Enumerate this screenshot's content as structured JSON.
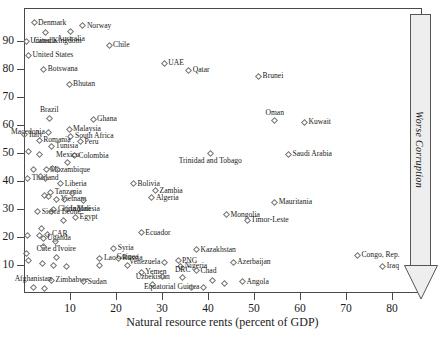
{
  "chart_data": {
    "type": "scatter",
    "title": "",
    "xlabel": "Natural resource rents (percent of GDP)",
    "ylabel": "",
    "xlim": [
      0,
      88
    ],
    "ylim": [
      0,
      98
    ],
    "xticks": [
      10,
      20,
      30,
      40,
      50,
      60,
      70,
      80
    ],
    "yticks": [
      10,
      20,
      30,
      40,
      50,
      60,
      70,
      80,
      90
    ],
    "grid": false,
    "legend": false,
    "annotation": {
      "text": "Worse Corruption",
      "direction": "down",
      "position": "right-outside"
    },
    "points": [
      {
        "label": "Denmark",
        "x": 2.2,
        "y": 96.5,
        "pos": "right"
      },
      {
        "label": "Norway",
        "x": 12.8,
        "y": 95.5,
        "pos": "right"
      },
      {
        "label": "Australia",
        "x": 10.2,
        "y": 93.5,
        "pos": "below"
      },
      {
        "label": "Canada",
        "x": 4.6,
        "y": 93.0,
        "pos": "below"
      },
      {
        "label": "Chile",
        "x": 18.5,
        "y": 88.5,
        "pos": "right"
      },
      {
        "label": "United Kingdom",
        "x": 0.5,
        "y": 90.0,
        "pos": "right"
      },
      {
        "label": "United States",
        "x": 1.0,
        "y": 85.0,
        "pos": "right"
      },
      {
        "label": "Botswana",
        "x": 4.3,
        "y": 80.0,
        "pos": "right"
      },
      {
        "label": "UAE",
        "x": 30.5,
        "y": 82.0,
        "pos": "right"
      },
      {
        "label": "Qatar",
        "x": 35.8,
        "y": 79.5,
        "pos": "right"
      },
      {
        "label": "Brunei",
        "x": 51.0,
        "y": 77.5,
        "pos": "right"
      },
      {
        "label": "Bhutan",
        "x": 9.8,
        "y": 74.5,
        "pos": "right"
      },
      {
        "label": "Brazil",
        "x": 5.5,
        "y": 62.5,
        "pos": "above"
      },
      {
        "label": "Ghana",
        "x": 15.0,
        "y": 62.0,
        "pos": "right"
      },
      {
        "label": "Oman",
        "x": 54.5,
        "y": 61.5,
        "pos": "above"
      },
      {
        "label": "Kuwait",
        "x": 61.0,
        "y": 61.0,
        "pos": "right"
      },
      {
        "label": "Malaysia",
        "x": 9.8,
        "y": 58.5,
        "pos": "right"
      },
      {
        "label": "Macedonia",
        "x": 5.4,
        "y": 57.5,
        "pos": "left"
      },
      {
        "label": "South Africa",
        "x": 10.2,
        "y": 56.0,
        "pos": "right"
      },
      {
        "label": "Italy",
        "x": 0.2,
        "y": 56.5,
        "pos": "right"
      },
      {
        "label": "Romania",
        "x": 3.3,
        "y": 54.5,
        "pos": "right"
      },
      {
        "label": "Peru",
        "x": 12.3,
        "y": 54.0,
        "pos": "right"
      },
      {
        "label": "Tunisia",
        "x": 6.0,
        "y": 52.5,
        "pos": "right"
      },
      {
        "label": "Colombia",
        "x": 11.0,
        "y": 49.0,
        "pos": "right"
      },
      {
        "label": "Trinidad and Tobago",
        "x": 40.5,
        "y": 50.0,
        "pos": "below"
      },
      {
        "label": "Saudi Arabia",
        "x": 57.5,
        "y": 49.5,
        "pos": "right"
      },
      {
        "label": "Mexico",
        "x": 9.5,
        "y": 46.5,
        "pos": "above"
      },
      {
        "label": "Mozambique",
        "x": 4.8,
        "y": 44.0,
        "pos": "right"
      },
      {
        "label": "Thailand",
        "x": 0.8,
        "y": 41.0,
        "pos": "right"
      },
      {
        "label": "Liberia",
        "x": 8.0,
        "y": 39.0,
        "pos": "right"
      },
      {
        "label": "Bolivia",
        "x": 23.8,
        "y": 39.0,
        "pos": "right"
      },
      {
        "label": "Zambia",
        "x": 28.6,
        "y": 36.5,
        "pos": "right"
      },
      {
        "label": "Tanzania",
        "x": 5.8,
        "y": 36.0,
        "pos": "right"
      },
      {
        "label": "Algeria",
        "x": 27.8,
        "y": 34.0,
        "pos": "right"
      },
      {
        "label": "Vietnam",
        "x": 7.1,
        "y": 33.5,
        "pos": "right"
      },
      {
        "label": "Mali",
        "x": 13.0,
        "y": 33.0,
        "pos": "below"
      },
      {
        "label": "Mauritania",
        "x": 54.5,
        "y": 32.5,
        "pos": "right"
      },
      {
        "label": "China",
        "x": 6.5,
        "y": 30.0,
        "pos": "right"
      },
      {
        "label": "Indonesia",
        "x": 9.2,
        "y": 30.0,
        "pos": "right"
      },
      {
        "label": "Sierra Leone",
        "x": 3.0,
        "y": 29.0,
        "pos": "right"
      },
      {
        "label": "Mongolia",
        "x": 44.0,
        "y": 28.0,
        "pos": "right"
      },
      {
        "label": "Egypt",
        "x": 11.2,
        "y": 27.0,
        "pos": "right"
      },
      {
        "label": "Timor-Leste",
        "x": 48.5,
        "y": 26.0,
        "pos": "right"
      },
      {
        "label": "Ecuador",
        "x": 25.5,
        "y": 21.5,
        "pos": "right"
      },
      {
        "label": "CAR",
        "x": 5.2,
        "y": 21.0,
        "pos": "right"
      },
      {
        "label": "Uganda",
        "x": 4.2,
        "y": 19.5,
        "pos": "right"
      },
      {
        "label": "Syria",
        "x": 19.5,
        "y": 16.0,
        "pos": "right"
      },
      {
        "label": "Kazakhstan",
        "x": 37.5,
        "y": 15.5,
        "pos": "right"
      },
      {
        "label": "Côte d'Ivoire",
        "x": 7.0,
        "y": 12.8,
        "pos": "above"
      },
      {
        "label": "Lao",
        "x": 16.5,
        "y": 12.5,
        "pos": "right"
      },
      {
        "label": "Russia",
        "x": 20.5,
        "y": 12.5,
        "pos": "right"
      },
      {
        "label": "Congo, Rep.",
        "x": 72.5,
        "y": 13.5,
        "pos": "right"
      },
      {
        "label": "Venezuela",
        "x": 30.5,
        "y": 11.0,
        "pos": "left"
      },
      {
        "label": "PNG",
        "x": 33.5,
        "y": 11.5,
        "pos": "right"
      },
      {
        "label": "Azerbaijan",
        "x": 45.5,
        "y": 11.0,
        "pos": "right"
      },
      {
        "label": "Guinea",
        "x": 22.5,
        "y": 10.0,
        "pos": "above"
      },
      {
        "label": "Nigeria",
        "x": 34.0,
        "y": 9.5,
        "pos": "right"
      },
      {
        "label": "Iraq",
        "x": 78.0,
        "y": 9.5,
        "pos": "right"
      },
      {
        "label": "Yemen",
        "x": 25.5,
        "y": 7.5,
        "pos": "right"
      },
      {
        "label": "Chad",
        "x": 37.5,
        "y": 8.0,
        "pos": "right"
      },
      {
        "label": "DRC",
        "x": 34.5,
        "y": 5.5,
        "pos": "above"
      },
      {
        "label": "Zimbabwe",
        "x": 6.0,
        "y": 4.5,
        "pos": "right"
      },
      {
        "label": "Sudan",
        "x": 13.0,
        "y": 4.0,
        "pos": "right"
      },
      {
        "label": "Uzbekistan",
        "x": 28.0,
        "y": 3.0,
        "pos": "above"
      },
      {
        "label": "Angola",
        "x": 47.5,
        "y": 4.0,
        "pos": "right"
      },
      {
        "label": "Equatorial Guinea",
        "x": 39.0,
        "y": 2.0,
        "pos": "left"
      },
      {
        "label": "Afghanistan",
        "x": 2.0,
        "y": 2.0,
        "pos": "above"
      },
      {
        "label": "",
        "x": 1.0,
        "y": 50.5,
        "pos": "right"
      },
      {
        "label": "",
        "x": 3.3,
        "y": 49.5,
        "pos": "right"
      },
      {
        "label": "",
        "x": 2.0,
        "y": 44.0,
        "pos": "right"
      },
      {
        "label": "",
        "x": 6.3,
        "y": 44.5,
        "pos": "right"
      },
      {
        "label": "",
        "x": 7.2,
        "y": 44.0,
        "pos": "right"
      },
      {
        "label": "",
        "x": 3.6,
        "y": 41.5,
        "pos": "right"
      },
      {
        "label": "",
        "x": 4.6,
        "y": 41.0,
        "pos": "right"
      },
      {
        "label": "",
        "x": 10.5,
        "y": 35.5,
        "pos": "right"
      },
      {
        "label": "",
        "x": 4.4,
        "y": 35.0,
        "pos": "right"
      },
      {
        "label": "",
        "x": 5.3,
        "y": 34.5,
        "pos": "right"
      },
      {
        "label": "",
        "x": 8.8,
        "y": 33.5,
        "pos": "right"
      },
      {
        "label": "",
        "x": 6.0,
        "y": 29.0,
        "pos": "right"
      },
      {
        "label": "",
        "x": 8.6,
        "y": 26.0,
        "pos": "right"
      },
      {
        "label": "",
        "x": 3.8,
        "y": 23.0,
        "pos": "right"
      },
      {
        "label": "",
        "x": 0.8,
        "y": 20.5,
        "pos": "right"
      },
      {
        "label": "",
        "x": 3.3,
        "y": 20.5,
        "pos": "right"
      },
      {
        "label": "",
        "x": 6.8,
        "y": 18.5,
        "pos": "right"
      },
      {
        "label": "",
        "x": 4.2,
        "y": 16.5,
        "pos": "right"
      },
      {
        "label": "",
        "x": 0.6,
        "y": 14.0,
        "pos": "right"
      },
      {
        "label": "",
        "x": 1.0,
        "y": 11.5,
        "pos": "right"
      },
      {
        "label": "",
        "x": 4.0,
        "y": 10.5,
        "pos": "right"
      },
      {
        "label": "",
        "x": 6.5,
        "y": 10.0,
        "pos": "right"
      },
      {
        "label": "",
        "x": 9.2,
        "y": 9.5,
        "pos": "right"
      },
      {
        "label": "",
        "x": 16.5,
        "y": 10.0,
        "pos": "right"
      },
      {
        "label": "",
        "x": 30.0,
        "y": 6.0,
        "pos": "right"
      },
      {
        "label": "",
        "x": 41.0,
        "y": 4.5,
        "pos": "right"
      },
      {
        "label": "",
        "x": 43.5,
        "y": 3.5,
        "pos": "right"
      },
      {
        "label": "",
        "x": 36.5,
        "y": 2.0,
        "pos": "right"
      },
      {
        "label": "",
        "x": 4.5,
        "y": 1.5,
        "pos": "right"
      }
    ]
  }
}
